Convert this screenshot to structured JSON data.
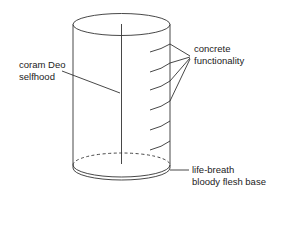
{
  "diagram": {
    "type": "cylinder-labeled",
    "labels": {
      "selfhood": [
        "coram Deo",
        "selfhood"
      ],
      "functionality": [
        "concrete",
        "functionality"
      ],
      "base": [
        "life-breath",
        "bloody flesh base"
      ]
    },
    "colors": {
      "stroke": "#333333",
      "text": "#222222",
      "background": "#ffffff"
    },
    "functionality_rings": 6
  }
}
